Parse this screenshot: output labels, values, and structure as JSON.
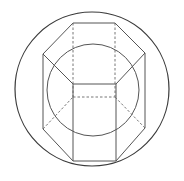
{
  "diagram": {
    "title": "",
    "colors": {
      "background": "#ffffff",
      "outer_circle": "#3a3a3a",
      "inner_circle": "#555555",
      "solid_edge": "#555555",
      "hidden_edge": "#666666"
    },
    "outer_circle": {
      "cx": 92,
      "cy": 89,
      "r": 77
    },
    "inner_circle": {
      "cx": 93,
      "cy": 90,
      "r": 46
    },
    "prism": {
      "top_face": [
        [
          73,
          23
        ],
        [
          115,
          23
        ],
        [
          145,
          53
        ],
        [
          116,
          84
        ],
        [
          73,
          84
        ],
        [
          43,
          54
        ]
      ],
      "bottom_visible": [
        [
          43,
          129
        ],
        [
          73,
          161
        ],
        [
          116,
          161
        ],
        [
          145,
          128
        ]
      ],
      "vertical_edges_solid": [
        [
          [
            43,
            54
          ],
          [
            43,
            129
          ]
        ],
        [
          [
            145,
            53
          ],
          [
            145,
            128
          ]
        ],
        [
          [
            73,
            84
          ],
          [
            73,
            161
          ]
        ],
        [
          [
            116,
            84
          ],
          [
            116,
            161
          ]
        ]
      ],
      "hidden_edges": [
        [
          [
            73,
            23
          ],
          [
            73,
            97
          ]
        ],
        [
          [
            115,
            23
          ],
          [
            115,
            97
          ]
        ],
        [
          [
            73,
            97
          ],
          [
            115,
            97
          ]
        ],
        [
          [
            43,
            129
          ],
          [
            73,
            97
          ]
        ],
        [
          [
            145,
            128
          ],
          [
            115,
            97
          ]
        ]
      ]
    }
  }
}
